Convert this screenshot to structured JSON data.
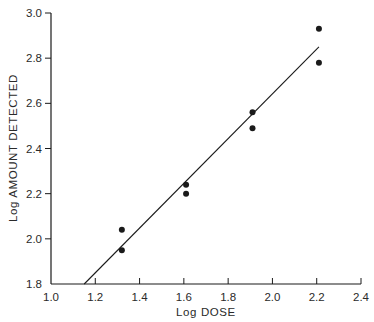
{
  "chart_data": {
    "type": "scatter",
    "title": "",
    "xlabel": "Log DOSE",
    "ylabel": "Log AMOUNT DETECTED",
    "xlim": [
      1.0,
      2.4
    ],
    "ylim": [
      1.8,
      3.0
    ],
    "grid": false,
    "legend": null,
    "x_ticks": [
      "1.0",
      "1.2",
      "1.4",
      "1.6",
      "1.8",
      "2.0",
      "2.2",
      "2.4"
    ],
    "y_ticks": [
      "1.8",
      "2.0",
      "2.2",
      "2.4",
      "2.6",
      "2.8",
      "3.0"
    ],
    "series": [
      {
        "name": "observed",
        "marker": "filled-circle",
        "points": [
          {
            "x": 1.32,
            "y": 2.04
          },
          {
            "x": 1.32,
            "y": 1.95
          },
          {
            "x": 1.61,
            "y": 2.24
          },
          {
            "x": 1.61,
            "y": 2.2
          },
          {
            "x": 1.91,
            "y": 2.56
          },
          {
            "x": 1.91,
            "y": 2.49
          },
          {
            "x": 2.21,
            "y": 2.93
          },
          {
            "x": 2.21,
            "y": 2.78
          }
        ]
      },
      {
        "name": "regression line",
        "marker": "line",
        "points": [
          {
            "x": 1.15,
            "y": 1.8
          },
          {
            "x": 2.21,
            "y": 2.85
          }
        ]
      }
    ]
  },
  "colors": {
    "ink": "#1a1a1a",
    "background": "#ffffff"
  }
}
